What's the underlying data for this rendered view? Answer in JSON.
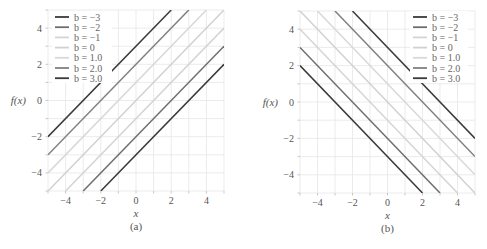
{
  "chart_data": [
    {
      "type": "line",
      "panel": "a",
      "caption": "(a)",
      "function": "f(x) = x + b",
      "xlabel": "x",
      "ylabel": "f(x)",
      "xlim": [
        -5,
        5
      ],
      "ylim": [
        -5,
        5
      ],
      "xticks": [
        -4,
        -2,
        0,
        2,
        4
      ],
      "yticks": [
        -4,
        -2,
        0,
        2,
        4
      ],
      "grid": true,
      "grid_step": 1,
      "legend_position": "upper left",
      "slope": 1,
      "series": [
        {
          "name": "b = −3",
          "b": -3,
          "color": "#3a3a3a",
          "points": [
            [
              -2,
              -5
            ],
            [
              5,
              2
            ]
          ]
        },
        {
          "name": "b = −2",
          "b": -2,
          "color": "#6e6e6e",
          "points": [
            [
              -3,
              -5
            ],
            [
              5,
              3
            ]
          ]
        },
        {
          "name": "b = −1",
          "b": -1,
          "color": "#d4d4d4",
          "points": [
            [
              -4,
              -5
            ],
            [
              5,
              4
            ]
          ]
        },
        {
          "name": "b = 0",
          "b": 0,
          "color": "#d0d0d0",
          "points": [
            [
              -5,
              -5
            ],
            [
              5,
              5
            ]
          ]
        },
        {
          "name": "b = 1.0",
          "b": 1.0,
          "color": "#d8d8d8",
          "points": [
            [
              -5,
              -4
            ],
            [
              4,
              5
            ]
          ]
        },
        {
          "name": "b = 2.0",
          "b": 2.0,
          "color": "#808080",
          "points": [
            [
              -5,
              -3
            ],
            [
              3,
              5
            ]
          ]
        },
        {
          "name": "b = 3.0",
          "b": 3.0,
          "color": "#3a3a3a",
          "points": [
            [
              -5,
              -2
            ],
            [
              2,
              5
            ]
          ]
        }
      ]
    },
    {
      "type": "line",
      "panel": "b",
      "caption": "(b)",
      "function": "f(x) = -x + b",
      "xlabel": "x",
      "ylabel": "f(x)",
      "xlim": [
        -5,
        5
      ],
      "ylim": [
        -5,
        5
      ],
      "xticks": [
        -4,
        -2,
        0,
        2,
        4
      ],
      "yticks": [
        -4,
        -2,
        0,
        2,
        4
      ],
      "grid": true,
      "grid_step": 1,
      "legend_position": "upper right",
      "slope": -1,
      "series": [
        {
          "name": "b = −3",
          "b": -3,
          "color": "#3a3a3a",
          "points": [
            [
              -5,
              2
            ],
            [
              2,
              -5
            ]
          ]
        },
        {
          "name": "b = −2",
          "b": -2,
          "color": "#6e6e6e",
          "points": [
            [
              -5,
              3
            ],
            [
              3,
              -5
            ]
          ]
        },
        {
          "name": "b = −1",
          "b": -1,
          "color": "#d4d4d4",
          "points": [
            [
              -5,
              4
            ],
            [
              4,
              -5
            ]
          ]
        },
        {
          "name": "b = 0",
          "b": 0,
          "color": "#d0d0d0",
          "points": [
            [
              -5,
              5
            ],
            [
              5,
              -5
            ]
          ]
        },
        {
          "name": "b = 1.0",
          "b": 1.0,
          "color": "#d8d8d8",
          "points": [
            [
              -4,
              5
            ],
            [
              5,
              -4
            ]
          ]
        },
        {
          "name": "b = 2.0",
          "b": 2.0,
          "color": "#808080",
          "points": [
            [
              -3,
              5
            ],
            [
              5,
              -3
            ]
          ]
        },
        {
          "name": "b = 3.0",
          "b": 3.0,
          "color": "#3a3a3a",
          "points": [
            [
              -2,
              5
            ],
            [
              5,
              -2
            ]
          ]
        }
      ]
    }
  ],
  "panels": [
    {
      "x0": 48,
      "x1": 224,
      "y0": 10,
      "y1": 191,
      "legend": {
        "x": 52,
        "y": 11,
        "w": 60,
        "h": 72
      }
    },
    {
      "x0": 300,
      "x1": 475,
      "y0": 11,
      "y1": 193,
      "legend": {
        "x": 410,
        "y": 11,
        "w": 58,
        "h": 72
      }
    }
  ],
  "tick_labels": {
    "-4": "−4",
    "-2": "−2",
    "0": "0",
    "2": "2",
    "4": "4"
  }
}
